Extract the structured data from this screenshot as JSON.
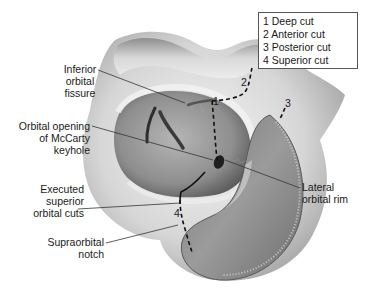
{
  "legend": {
    "items": [
      {
        "number": "1",
        "label": "Deep cut"
      },
      {
        "number": "2",
        "label": "Anterior cut"
      },
      {
        "number": "3",
        "label": "Posterior cut"
      },
      {
        "number": "4",
        "label": "Superior cut"
      }
    ]
  },
  "callouts": {
    "inferior_orbital_fissure": "Inferior\norbital\nfissure",
    "orbital_opening": "Orbital opening\nof McCarty\nkeyhole",
    "executed_superior_cuts": "Executed\nsuperior\norbital cuts",
    "supraorbital_notch": "Supraorbital\nnotch",
    "lateral_orbital_rim": "Lateral\norbital rim"
  },
  "cut_markers": {
    "m1": "1",
    "m2": "2",
    "m3": "3",
    "m4": "4"
  },
  "colors": {
    "bone_light": "#e6e6e6",
    "bone_mid": "#bdbdbd",
    "orbit_dark": "#8a8a8a",
    "dura": "#9a9a9a",
    "ink": "#1a1a1a"
  }
}
